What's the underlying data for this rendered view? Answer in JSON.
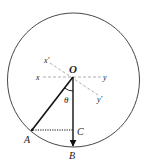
{
  "diagram": {
    "type": "geometry-pendulum",
    "labels": {
      "O": "O",
      "A": "A",
      "B": "B",
      "C": "C",
      "x": "x",
      "y": "y",
      "x_prime": "x'",
      "y_prime": "y'",
      "theta": "θ"
    },
    "colors": {
      "stroke": "#111111",
      "axis_dashed": "#999999",
      "circle": "#333333"
    }
  }
}
